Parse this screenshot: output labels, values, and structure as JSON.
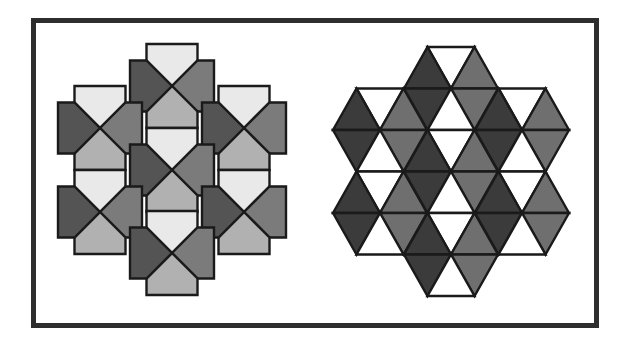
{
  "figure": {
    "colors": {
      "frame": "#2e2e2e",
      "outline": "#1a1a1a",
      "left_light": "#e9e9e9",
      "left_dark": "#545454",
      "left_medium": "#7b7b7b",
      "left_lightmedium": "#b1b1b1",
      "right_white": "#ffffff",
      "right_dark": "#3b3b3b",
      "right_medium": "#6f6f6f"
    },
    "left_pattern": {
      "name": "pentagon-flower-tiling",
      "petal": {
        "half_width": 25.5,
        "depth": 42,
        "shoulder": 25.5
      },
      "petal_colors": {
        "top": "left_light",
        "left": "left_dark",
        "right": "left_medium",
        "bottom": "left_lightmedium"
      },
      "flowers": [
        {
          "cx": 172,
          "cy": 86
        },
        {
          "cx": 100,
          "cy": 128
        },
        {
          "cx": 244,
          "cy": 128
        },
        {
          "cx": 172,
          "cy": 170
        },
        {
          "cx": 100,
          "cy": 212
        },
        {
          "cx": 244,
          "cy": 212
        },
        {
          "cx": 172,
          "cy": 253
        }
      ]
    },
    "right_pattern": {
      "name": "triangle-hexagon-tiling",
      "hex": {
        "side": 47,
        "height": 41.5
      },
      "triangle_colors": {
        "top": "right_white",
        "upper_left": "right_dark",
        "upper_right": "right_medium",
        "lower_left": "right_dark",
        "lower_right": "right_medium",
        "bottom": "right_white"
      },
      "hexagons": [
        {
          "cx": 451,
          "cy": 88.5
        },
        {
          "cx": 380,
          "cy": 130
        },
        {
          "cx": 522,
          "cy": 130
        },
        {
          "cx": 451,
          "cy": 171.5
        },
        {
          "cx": 380,
          "cy": 213
        },
        {
          "cx": 522,
          "cy": 213
        },
        {
          "cx": 451,
          "cy": 254.5
        }
      ]
    }
  }
}
